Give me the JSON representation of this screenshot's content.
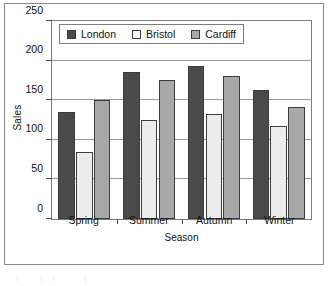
{
  "chart_data": {
    "type": "bar",
    "title": "",
    "xlabel": "Season",
    "ylabel": "Sales",
    "categories": [
      "Spring",
      "Summer",
      "Autumn",
      "Winter"
    ],
    "series": [
      {
        "name": "London",
        "color": "#4a4a4a",
        "values": [
          135,
          185,
          193,
          163
        ]
      },
      {
        "name": "Bristol",
        "color": "#ececec",
        "values": [
          85,
          125,
          132,
          117
        ]
      },
      {
        "name": "Cardiff",
        "color": "#a8a8a8",
        "values": [
          150,
          175,
          180,
          142
        ]
      }
    ],
    "ylim": [
      0,
      250
    ],
    "yticks": [
      0,
      50,
      100,
      150,
      200,
      250
    ],
    "ytick_labels": [
      "0",
      "50",
      "100",
      "150",
      "200",
      "250"
    ],
    "grid": true,
    "legend_position": "top-left-inside"
  }
}
